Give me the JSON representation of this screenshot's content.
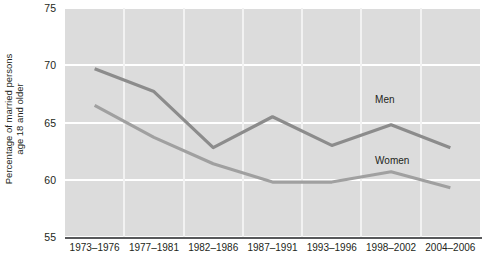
{
  "chart_data": {
    "type": "line",
    "title": "",
    "xlabel": "",
    "ylabel": "Percentage of married persons\nage 18 and older",
    "ylim": [
      55,
      75
    ],
    "yticks": [
      55,
      60,
      65,
      70,
      75
    ],
    "ytick_labels": [
      "55",
      "60",
      "65",
      "70",
      "75"
    ],
    "grid": true,
    "legend_position": "inline-annotation",
    "categories": [
      "1973–1976",
      "1977–1981",
      "1982–1986",
      "1987–1991",
      "1993–1996",
      "1998–2002",
      "2004–2006"
    ],
    "series": [
      {
        "name": "Men",
        "color": "#8c8c8c",
        "values": [
          69.7,
          67.7,
          62.8,
          65.5,
          63.0,
          64.8,
          62.8
        ]
      },
      {
        "name": "Women",
        "color": "#a0a0a0",
        "values": [
          66.5,
          63.7,
          61.4,
          59.8,
          59.8,
          60.7,
          59.3
        ]
      }
    ],
    "annotations": [
      {
        "text": "Men",
        "category": "1998–2002",
        "value": 67.0
      },
      {
        "text": "Women",
        "category": "1998–2002",
        "value": 61.6
      }
    ]
  },
  "style": {
    "panel_background": "#dcdcdc",
    "gridline_color": "#ffffff",
    "axis_color": "#58595b",
    "text_color": "#231f20"
  }
}
